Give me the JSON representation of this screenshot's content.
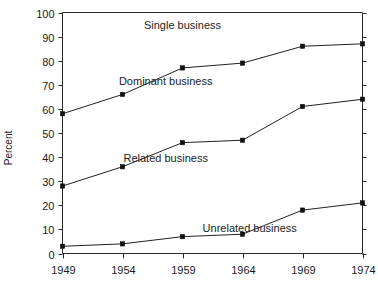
{
  "chart_data": {
    "type": "line",
    "title": "",
    "xlabel": "",
    "ylabel": "Percent",
    "categories": [
      "1949",
      "1954",
      "1959",
      "1964",
      "1969",
      "1974"
    ],
    "x": [
      1949,
      1954,
      1959,
      1964,
      1969,
      1974
    ],
    "xlim": [
      1949,
      1974
    ],
    "ylim": [
      0,
      100
    ],
    "y_ticks": [
      "0",
      "10",
      "20",
      "30",
      "40",
      "50",
      "60",
      "70",
      "80",
      "90",
      "100"
    ],
    "y_tick_values": [
      0,
      10,
      20,
      30,
      40,
      50,
      60,
      70,
      80,
      90,
      100
    ],
    "grid": false,
    "legend_position": "inline-annotations",
    "markers": "filled-square",
    "series": [
      {
        "name": "Single business",
        "values": [
          58,
          66,
          77,
          79,
          86,
          87
        ],
        "label_x": 1959.0,
        "label_y": 93
      },
      {
        "name": "Dominant business",
        "values": [
          28,
          36,
          46,
          47,
          61,
          64
        ],
        "label_x": 1957.6,
        "label_y": 70
      },
      {
        "name": "Related business",
        "values": [
          0,
          0,
          0,
          0,
          0,
          0
        ],
        "annotation_only": true,
        "label_x": 1957.6,
        "label_y": 38
      },
      {
        "name": "Unrelated business",
        "values": [
          3,
          4,
          7,
          8,
          18,
          21
        ],
        "label_x": 1964.6,
        "label_y": 9
      }
    ],
    "annotations": [
      {
        "text": "Single business",
        "x": 1959.0,
        "y": 93
      },
      {
        "text": "Dominant business",
        "x": 1957.6,
        "y": 70
      },
      {
        "text": "Related business",
        "x": 1957.6,
        "y": 38
      },
      {
        "text": "Unrelated business",
        "x": 1964.6,
        "y": 9
      }
    ],
    "plotted_series": [
      {
        "name": "Single business",
        "values": [
          58,
          66,
          77,
          79,
          86,
          87
        ]
      },
      {
        "name": "Dominant business",
        "values": [
          28,
          36,
          46,
          47,
          61,
          64
        ]
      },
      {
        "name": "Unrelated business",
        "values": [
          3,
          4,
          7,
          8,
          18,
          21
        ]
      }
    ],
    "colors": {
      "line": "#222222",
      "marker": "#111111",
      "axis": "#2a2a2a",
      "text": "#1c1c1c",
      "background": "#ffffff"
    }
  }
}
